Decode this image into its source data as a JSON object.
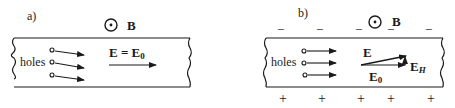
{
  "panels": {
    "a": {
      "label": "a)",
      "field_symbol": "B",
      "field_direction": "out-of-page",
      "carrier_label": "holes",
      "equation": "E = E",
      "equation_subscript": "0"
    },
    "b": {
      "label": "b)",
      "field_symbol": "B",
      "field_direction": "out-of-page",
      "carrier_label": "holes",
      "top_charges": [
        "−",
        "−",
        "−",
        "−",
        "−"
      ],
      "bottom_charges": [
        "+",
        "+",
        "+",
        "+",
        "+"
      ],
      "vector_E_label": "E",
      "vector_E0_label": "E",
      "vector_E0_subscript": "0",
      "vector_EH_label": "E",
      "vector_EH_subscript": "H"
    }
  },
  "colors": {
    "ink": "#1a1a1a",
    "background": "#ffffff"
  }
}
